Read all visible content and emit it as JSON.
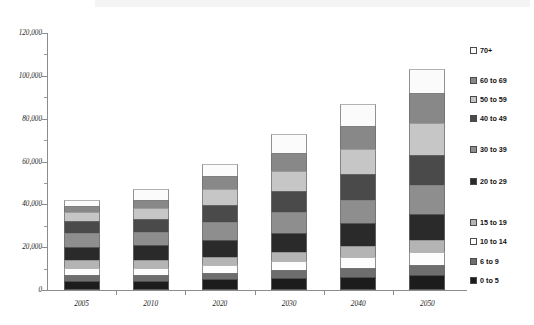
{
  "chart_data": {
    "type": "bar",
    "subtype": "stacked-column",
    "title": "",
    "xlabel": "",
    "ylabel": "",
    "categories": [
      "2005",
      "2010",
      "2020",
      "2030",
      "2040",
      "2050"
    ],
    "ylim": [
      0,
      120000
    ],
    "yticks": [
      0,
      20000,
      40000,
      60000,
      80000,
      100000,
      120000
    ],
    "ytick_labels": [
      "0",
      "20,000",
      "40,000",
      "60,000",
      "80,000",
      "100,000",
      "120,000"
    ],
    "grid": false,
    "legend_position": "right",
    "stack_order_top_to_bottom": [
      "70+",
      "60 to 69",
      "50 to 59",
      "40 to 49",
      "30 to 39",
      "20 to 29",
      "15 to 19",
      "10 to 14",
      "6 to 9",
      "0 to 5"
    ],
    "series": [
      {
        "name": "0 to 5",
        "color": "#1c1c1c",
        "values": [
          4200,
          4300,
          4900,
          5400,
          6100,
          6800
        ]
      },
      {
        "name": "6 to 9",
        "color": "#6e6e6e",
        "values": [
          2800,
          2700,
          3200,
          3700,
          4300,
          4900
        ]
      },
      {
        "name": "10 to 14",
        "color": "#fdfdfd",
        "values": [
          3500,
          3300,
          3700,
          4400,
          5200,
          6000
        ]
      },
      {
        "name": "15 to 19",
        "color": "#b4b4b4",
        "values": [
          3400,
          3500,
          3400,
          4100,
          4900,
          5700
        ]
      },
      {
        "name": "20 to 29",
        "color": "#2a2a2a",
        "values": [
          6400,
          7000,
          8200,
          9200,
          10600,
          12300
        ]
      },
      {
        "name": "30 to 39",
        "color": "#8e8e8e",
        "values": [
          6100,
          6300,
          8400,
          9400,
          11000,
          13200
        ]
      },
      {
        "name": "40 to 49",
        "color": "#4a4a4a",
        "values": [
          5700,
          6200,
          8000,
          10100,
          11900,
          14300
        ]
      },
      {
        "name": "50 to 59",
        "color": "#c6c6c6",
        "values": [
          4200,
          5000,
          7400,
          9500,
          11800,
          14900
        ]
      },
      {
        "name": "60 to 69",
        "color": "#888888",
        "values": [
          3000,
          3600,
          6100,
          8400,
          10700,
          13900
        ]
      },
      {
        "name": "70+",
        "color": "#fbfbfb",
        "values": [
          2700,
          5100,
          5700,
          8800,
          10500,
          11000
        ]
      }
    ],
    "totals": [
      42000,
      47000,
      59000,
      73000,
      87000,
      103000
    ]
  },
  "legend": {
    "items": [
      {
        "label": "70+",
        "color": "#fbfbfb"
      },
      {
        "label": "60 to 69",
        "color": "#888888"
      },
      {
        "label": "50 to 59",
        "color": "#c6c6c6"
      },
      {
        "label": "40 to 49",
        "color": "#4a4a4a"
      },
      {
        "label": "30 to 39",
        "color": "#8e8e8e"
      },
      {
        "label": "20 to 29",
        "color": "#2a2a2a"
      },
      {
        "label": "15 to 19",
        "color": "#b4b4b4"
      },
      {
        "label": "10 to 14",
        "color": "#fdfdfd"
      },
      {
        "label": "6 to 9",
        "color": "#6e6e6e"
      },
      {
        "label": "0 to 5",
        "color": "#1c1c1c"
      }
    ]
  },
  "axes": {
    "y_tick_labels": [
      "120,000",
      "100,000",
      "80,000",
      "60,000",
      "40,000",
      "20,000",
      "0"
    ],
    "x_tick_labels": [
      "2005",
      "2010",
      "2020",
      "2030",
      "2040",
      "2050"
    ]
  }
}
